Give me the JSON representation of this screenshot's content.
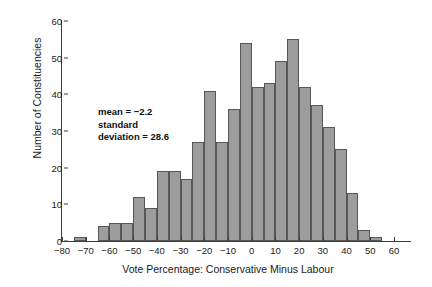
{
  "figure": {
    "top_caption": "",
    "ylabel": "Number of Constituencies",
    "xlabel": "Vote Percentage: Conservative Minus Labour",
    "annotation_line1": "mean = −2.2",
    "annotation_line2": "standard",
    "annotation_line3": "deviation = 28.6",
    "bar_fill": "#9d9d9d",
    "bar_stroke": "#575757",
    "axis_color": "#3d3d3d"
  },
  "chart_data": {
    "type": "bar",
    "title": "",
    "xlabel": "Vote Percentage: Conservative Minus Labour",
    "ylabel": "Number of Constituencies",
    "xlim": [
      -80,
      60
    ],
    "ylim": [
      0,
      60
    ],
    "xticks": [
      -80,
      -70,
      -60,
      -50,
      -40,
      -30,
      -20,
      -10,
      0,
      10,
      20,
      30,
      40,
      50,
      60
    ],
    "yticks": [
      0,
      10,
      20,
      30,
      40,
      50,
      60
    ],
    "xtick_labels": [
      "−80",
      "−70",
      "−60",
      "−50",
      "−40",
      "−30",
      "−20",
      "−10",
      "0",
      "10",
      "20",
      "30",
      "40",
      "50",
      "60"
    ],
    "ytick_labels": [
      "0",
      "10",
      "20",
      "30",
      "40",
      "50",
      "60"
    ],
    "grid": false,
    "legend": null,
    "bin_width": 5,
    "bin_starts": [
      -75,
      -70,
      -65,
      -60,
      -55,
      -50,
      -45,
      -40,
      -35,
      -30,
      -25,
      -20,
      -15,
      -10,
      -5,
      0,
      5,
      10,
      15,
      20,
      25,
      30,
      35,
      40,
      45,
      50
    ],
    "categories": [
      "-75",
      "-70",
      "-65",
      "-60",
      "-55",
      "-50",
      "-45",
      "-40",
      "-35",
      "-30",
      "-25",
      "-20",
      "-15",
      "-10",
      "-5",
      "0",
      "5",
      "10",
      "15",
      "20",
      "25",
      "30",
      "35",
      "40",
      "45",
      "50"
    ],
    "values": [
      1,
      0,
      4,
      5,
      5,
      12,
      9,
      19,
      19,
      17,
      27,
      41,
      27,
      36,
      54,
      42,
      43,
      49,
      55,
      42,
      37,
      31,
      25,
      13,
      3,
      1
    ],
    "annotations": [
      {
        "text": "mean = −2.2",
        "x": -42,
        "y": 40
      },
      {
        "text": "standard",
        "x": -42,
        "y": 37
      },
      {
        "text": "deviation = 28.6",
        "x": -42,
        "y": 34
      }
    ],
    "statistics": {
      "mean": -2.2,
      "standard_deviation": 28.6
    }
  }
}
